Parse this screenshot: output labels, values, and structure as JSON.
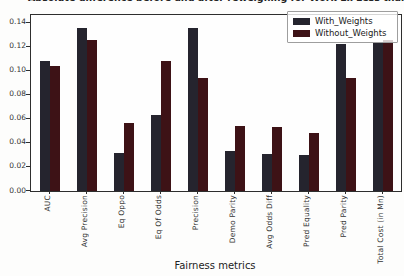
{
  "title": "Absolute difference before and after reweighing for Work Ex Less than 10",
  "xlabel": "Fairness metrics",
  "legend": {
    "entries": [
      {
        "label": "With_Weights",
        "color": "#25242e"
      },
      {
        "label": "Without_Weights",
        "color": "#3d1216"
      }
    ]
  },
  "chart_data": {
    "type": "bar",
    "title": "Absolute difference before and after reweighing for Work Ex Less than 10",
    "xlabel": "Fairness metrics",
    "ylabel": "",
    "categories": [
      "AUC",
      "Avg Precision",
      "Eq Oppo",
      "Eq Of Odds",
      "Precision",
      "Demo Parity",
      "Avg Odds Diff",
      "Pred Equality",
      "Pred Parity",
      "Total Cost (in Mn)"
    ],
    "series": [
      {
        "name": "With_Weights",
        "color": "#25242e",
        "values": [
          0.108,
          0.136,
          0.032,
          0.063,
          0.136,
          0.033,
          0.031,
          0.03,
          0.122,
          0.123
        ]
      },
      {
        "name": "Without_Weights",
        "color": "#3d1216",
        "values": [
          0.104,
          0.126,
          0.057,
          0.108,
          0.094,
          0.054,
          0.053,
          0.048,
          0.094,
          0.126
        ]
      }
    ],
    "yticks": [
      0.0,
      0.02,
      0.04,
      0.06,
      0.08,
      0.1,
      0.12,
      0.14
    ],
    "ylim": [
      0,
      0.1465
    ],
    "grid": false,
    "legend_position": "upper right",
    "xtick_rotation": 90
  }
}
